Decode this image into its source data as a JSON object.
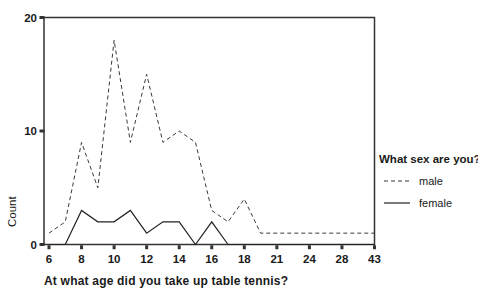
{
  "chart_data": {
    "type": "line",
    "title": "",
    "xlabel": "At what age did you take up table tennis?",
    "ylabel": "Count",
    "categories": [
      6,
      7,
      8,
      9,
      10,
      11,
      12,
      13,
      14,
      15,
      16,
      17,
      18,
      20,
      21,
      23,
      24,
      26,
      28,
      30,
      43
    ],
    "x_tick_labels": [
      "6",
      "8",
      "10",
      "12",
      "14",
      "16",
      "18",
      "21",
      "24",
      "28",
      "43"
    ],
    "x_tick_every": 2,
    "y_ticks": [
      "0",
      "10",
      "20"
    ],
    "ylim": [
      0,
      20
    ],
    "grid": false,
    "legend": {
      "title": "What sex are you?",
      "position": "right"
    },
    "series": [
      {
        "name": "male",
        "style": "dashed",
        "color": "#3a3a3a",
        "values": [
          1,
          2,
          9,
          5,
          18,
          9,
          15,
          9,
          10,
          9,
          3,
          2,
          4,
          1,
          1,
          1,
          1,
          1,
          1,
          1,
          1
        ]
      },
      {
        "name": "female",
        "style": "solid",
        "color": "#222222",
        "values": [
          0,
          0,
          3,
          2,
          2,
          3,
          1,
          2,
          2,
          0,
          2,
          0,
          0,
          0,
          0,
          0,
          0,
          0,
          0,
          0,
          0
        ]
      }
    ],
    "colors": {
      "frame": "#333333",
      "text": "#1a1a1a",
      "background": "#ffffff"
    }
  }
}
